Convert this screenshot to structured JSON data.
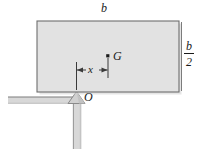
{
  "figure": {
    "colors": {
      "plate_fill": "#e2e2e2",
      "plate_stroke": "#6e6e6e",
      "support_fill": "#d4d4d4",
      "support_stroke": "#8a8a8a",
      "line": "#3a3a3a",
      "text": "#1a1a1a",
      "background": "#ffffff"
    },
    "labels": {
      "width_top": "b",
      "height_right_numerator": "b",
      "height_right_denominator": "2",
      "centroid": "G",
      "distance": "x",
      "pivot": "O"
    },
    "geometry": {
      "plate_left": 37,
      "plate_top": 21,
      "plate_right": 179,
      "plate_bottom": 92,
      "pivot_x": 76,
      "pivot_y": 92,
      "centroid_x": 108,
      "centroid_y": 57,
      "dim_line_y": 70
    }
  }
}
